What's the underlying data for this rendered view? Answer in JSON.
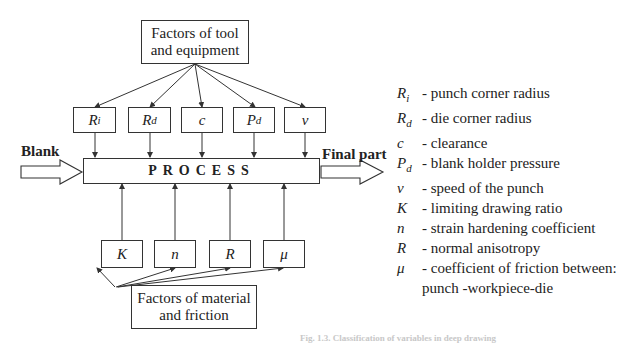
{
  "diagram": {
    "top_group": {
      "label_line1": "Factors of tool",
      "label_line2": "and equipment"
    },
    "tool_vars": [
      {
        "sym": "R",
        "sub": "i"
      },
      {
        "sym": "R",
        "sub": "d"
      },
      {
        "sym": "c",
        "sub": ""
      },
      {
        "sym": "P",
        "sub": "d"
      },
      {
        "sym": "ν",
        "sub": ""
      }
    ],
    "process_label": "PROCESS",
    "input_label": "Blank",
    "output_label": "Final part",
    "material_vars": [
      {
        "sym": "K",
        "sub": ""
      },
      {
        "sym": "n",
        "sub": ""
      },
      {
        "sym": "R",
        "sub": ""
      },
      {
        "sym": "μ",
        "sub": ""
      }
    ],
    "bottom_group": {
      "label_line1": "Factors of material",
      "label_line2": "and friction"
    }
  },
  "legend": [
    {
      "sym": "R",
      "sub": "i",
      "desc": "- punch corner radius"
    },
    {
      "sym": "R",
      "sub": "d",
      "desc": "- die corner radius"
    },
    {
      "sym": "c",
      "sub": "",
      "desc": "- clearance"
    },
    {
      "sym": "P",
      "sub": "d",
      "desc": "- blank holder pressure"
    },
    {
      "sym": "ν",
      "sub": "",
      "desc": "- speed of the punch"
    },
    {
      "sym": "K",
      "sub": "",
      "desc": "- limiting drawing ratio"
    },
    {
      "sym": "n",
      "sub": "",
      "desc": "- strain hardening coefficient"
    },
    {
      "sym": "R",
      "sub": "",
      "desc": "- normal anisotropy"
    },
    {
      "sym": "μ",
      "sub": "",
      "desc": "- coefficient of friction between:"
    },
    {
      "sym": "",
      "sub": "",
      "desc": "punch -workpiece-die"
    }
  ],
  "caption": "Fig. 1.3. Classification of variables in deep drawing"
}
